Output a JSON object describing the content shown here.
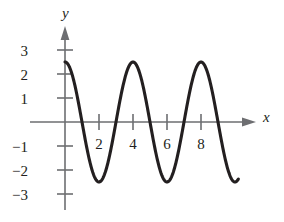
{
  "figure": {
    "background_color": "#ffffff",
    "axis_color": "#6d6e71",
    "curve_color": "#231f20",
    "text_color": "#231f20"
  },
  "axes": {
    "x_axis_name": "x",
    "y_axis_name": "y",
    "x_ticks": [
      {
        "value": 2,
        "label": "2"
      },
      {
        "value": 4,
        "label": "4"
      },
      {
        "value": 6,
        "label": "6"
      },
      {
        "value": 8,
        "label": "8"
      }
    ],
    "y_ticks": [
      {
        "value": 3,
        "label": "3"
      },
      {
        "value": 2,
        "label": "2"
      },
      {
        "value": 1,
        "label": "1"
      },
      {
        "value": -1,
        "label": "−1"
      },
      {
        "value": -2,
        "label": "−2"
      },
      {
        "value": -3,
        "label": "−3"
      }
    ]
  },
  "chart_data": {
    "type": "line",
    "title": "",
    "subtitle": "",
    "xlabel": "x",
    "ylabel": "y",
    "xlim": [
      -0.4,
      10.5
    ],
    "ylim": [
      -3.9,
      3.5
    ],
    "grid": false,
    "legend": null,
    "series": [
      {
        "name": "y = 2.5 cos(pi x / 2)",
        "amplitude": 2.5,
        "period": 4,
        "phase": 0,
        "x_start": 0,
        "x_end": 10.2,
        "x": [
          0,
          0.25,
          0.5,
          0.75,
          1,
          1.25,
          1.5,
          1.75,
          2,
          2.25,
          2.5,
          2.75,
          3,
          3.25,
          3.5,
          3.75,
          4,
          4.25,
          4.5,
          4.75,
          5,
          5.25,
          5.5,
          5.75,
          6,
          6.25,
          6.5,
          6.75,
          7,
          7.25,
          7.5,
          7.75,
          8,
          8.25,
          8.5,
          8.75,
          9,
          9.25,
          9.5,
          9.75,
          10,
          10.2
        ],
        "y": [
          2.5,
          2.31,
          1.77,
          0.96,
          0,
          -0.96,
          -1.77,
          -2.31,
          -2.5,
          -2.31,
          -1.77,
          -0.96,
          0,
          0.96,
          1.77,
          2.31,
          2.5,
          2.31,
          1.77,
          0.96,
          0,
          -0.96,
          -1.77,
          -2.31,
          -2.5,
          -2.31,
          -1.77,
          -0.96,
          0,
          0.96,
          1.77,
          2.31,
          2.5,
          2.31,
          1.77,
          0.96,
          0,
          -0.96,
          -1.77,
          -2.31,
          -2.5,
          -2.44
        ]
      }
    ],
    "maxima": [
      {
        "x": 0,
        "y": 2.5
      },
      {
        "x": 4,
        "y": 2.5
      },
      {
        "x": 8,
        "y": 2.5
      }
    ],
    "minima": [
      {
        "x": 2,
        "y": -2.5
      },
      {
        "x": 6,
        "y": -2.5
      },
      {
        "x": 10,
        "y": -2.5
      }
    ],
    "zeros": [
      1,
      3,
      5,
      7,
      9
    ]
  }
}
